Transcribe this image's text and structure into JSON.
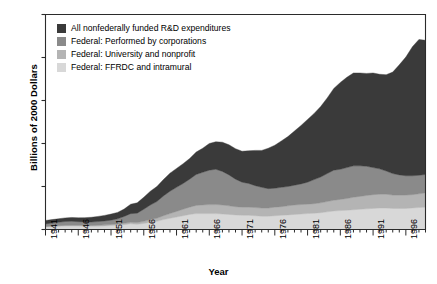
{
  "chart_data": {
    "type": "area",
    "stacked": true,
    "title": "",
    "xlabel": "Year",
    "ylabel": "Billions of 2000 Dollars",
    "xlim": [
      1941,
      1999
    ],
    "ylim": [
      0,
      250
    ],
    "yticks": [
      0,
      50,
      100,
      150,
      200,
      250
    ],
    "xticks": [
      1941,
      1946,
      1951,
      1956,
      1961,
      1966,
      1971,
      1976,
      1981,
      1986,
      1991,
      1996
    ],
    "xtick_labels": [
      "1941",
      "1946",
      "1951",
      "1956",
      "1961",
      "1966",
      "1971",
      "1976",
      "1981",
      "1986",
      "1991",
      "1996"
    ],
    "ytick_labels": [
      "0",
      "50",
      "100",
      "150",
      "200",
      "250"
    ],
    "grid": false,
    "legend_position": "top-left",
    "x": [
      1941,
      1942,
      1943,
      1944,
      1945,
      1946,
      1947,
      1948,
      1949,
      1950,
      1951,
      1952,
      1953,
      1954,
      1955,
      1956,
      1957,
      1958,
      1959,
      1960,
      1961,
      1962,
      1963,
      1964,
      1965,
      1966,
      1967,
      1968,
      1969,
      1970,
      1971,
      1972,
      1973,
      1974,
      1975,
      1976,
      1977,
      1978,
      1979,
      1980,
      1981,
      1982,
      1983,
      1984,
      1985,
      1986,
      1987,
      1988,
      1989,
      1990,
      1991,
      1992,
      1993,
      1994,
      1995,
      1996,
      1997,
      1998,
      1999
    ],
    "series": [
      {
        "name": "Federal: FFRDC and intramural",
        "color": "#d8d8d8",
        "values": [
          3.0,
          3.4,
          3.8,
          4.0,
          4.1,
          4.0,
          3.8,
          3.7,
          3.9,
          4.2,
          4.6,
          5.0,
          5.6,
          6.6,
          6.0,
          7.0,
          8.5,
          9.5,
          11.5,
          13.0,
          14.5,
          16.0,
          17.5,
          18.5,
          18.5,
          18.5,
          18.5,
          18.0,
          17.5,
          17.0,
          16.5,
          16.5,
          16.0,
          15.5,
          15.5,
          16.0,
          16.5,
          17.0,
          17.5,
          18.0,
          18.5,
          19.0,
          19.5,
          20.5,
          21.5,
          22.0,
          22.5,
          23.0,
          23.5,
          24.0,
          24.5,
          25.0,
          25.0,
          24.5,
          24.5,
          24.5,
          25.0,
          25.5,
          26.0
        ]
      },
      {
        "name": "Federal: University and nonprofit",
        "color": "#b4b4b4",
        "values": [
          0.5,
          0.6,
          0.7,
          0.8,
          0.9,
          0.9,
          1.0,
          1.0,
          1.1,
          1.2,
          1.3,
          1.4,
          1.6,
          1.8,
          2.0,
          2.5,
          3.0,
          3.5,
          4.5,
          5.5,
          6.5,
          7.5,
          8.5,
          9.5,
          10.0,
          10.5,
          10.5,
          10.5,
          10.0,
          9.5,
          9.5,
          9.5,
          9.5,
          9.5,
          9.5,
          10.0,
          10.0,
          10.5,
          11.0,
          11.0,
          11.0,
          11.0,
          11.5,
          12.0,
          12.5,
          13.0,
          13.5,
          14.5,
          15.0,
          15.5,
          16.0,
          16.0,
          16.0,
          15.5,
          15.5,
          15.5,
          15.5,
          16.0,
          16.5
        ]
      },
      {
        "name": "Federal: Performed by corporations",
        "color": "#8a8a8a",
        "values": [
          3.0,
          3.5,
          4.0,
          4.5,
          4.5,
          4.2,
          4.0,
          4.0,
          4.2,
          4.5,
          5.0,
          6.0,
          8.0,
          10.0,
          11.0,
          14.0,
          17.0,
          19.5,
          23.0,
          26.0,
          28.0,
          30.0,
          32.5,
          36.0,
          38.0,
          40.0,
          41.0,
          39.0,
          36.0,
          32.0,
          29.0,
          27.5,
          25.5,
          24.0,
          22.5,
          22.0,
          22.5,
          22.5,
          23.0,
          24.0,
          25.5,
          28.0,
          30.0,
          32.5,
          35.0,
          35.0,
          36.0,
          36.5,
          35.5,
          34.0,
          31.5,
          29.5,
          27.0,
          25.0,
          23.5,
          22.5,
          22.0,
          21.5,
          21.5
        ]
      },
      {
        "name": "All nonfederally funded R&D expenditures",
        "color": "#3a3a3a",
        "values": [
          4.0,
          4.0,
          4.0,
          4.2,
          4.5,
          4.5,
          5.0,
          5.5,
          6.0,
          6.5,
          7.0,
          7.5,
          8.5,
          11.0,
          12.0,
          14.0,
          16.0,
          17.5,
          19.0,
          21.0,
          22.0,
          23.0,
          24.0,
          26.0,
          28.0,
          31.0,
          32.0,
          34.0,
          35.0,
          35.5,
          36.0,
          38.0,
          41.0,
          43.0,
          47.0,
          50.0,
          54.0,
          58.0,
          63.0,
          68.0,
          73.0,
          77.0,
          82.0,
          88.0,
          95.0,
          101.0,
          105.0,
          108.0,
          108.0,
          108.0,
          110.0,
          110.0,
          112.0,
          118.0,
          128.0,
          138.0,
          150.0,
          158.0,
          156.0
        ]
      }
    ],
    "legend": [
      {
        "label": "All nonfederally funded R&D expenditures",
        "color": "#3a3a3a"
      },
      {
        "label": "Federal: Performed by corporations",
        "color": "#8a8a8a"
      },
      {
        "label": "Federal: University and nonprofit",
        "color": "#b4b4b4"
      },
      {
        "label": "Federal: FFRDC and intramural",
        "color": "#d8d8d8"
      }
    ]
  }
}
